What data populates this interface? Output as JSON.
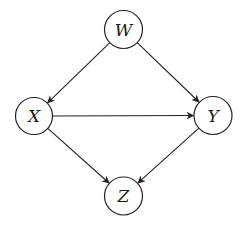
{
  "diagram": {
    "type": "directed-acyclic-graph",
    "nodes": [
      {
        "id": "W",
        "label": "W",
        "cx": 123.5,
        "cy": 29.5,
        "r": 19
      },
      {
        "id": "X",
        "label": "X",
        "cx": 34,
        "cy": 116,
        "r": 18.5
      },
      {
        "id": "Y",
        "label": "Y",
        "cx": 213,
        "cy": 115.5,
        "r": 19
      },
      {
        "id": "Z",
        "label": "Z",
        "cx": 123.5,
        "cy": 196,
        "r": 19
      }
    ],
    "edges": [
      {
        "from": "W",
        "to": "X"
      },
      {
        "from": "W",
        "to": "Y"
      },
      {
        "from": "X",
        "to": "Y"
      },
      {
        "from": "X",
        "to": "Z"
      },
      {
        "from": "Y",
        "to": "Z"
      }
    ],
    "colors": {
      "stroke": "#222222",
      "background": "#ffffff"
    }
  }
}
